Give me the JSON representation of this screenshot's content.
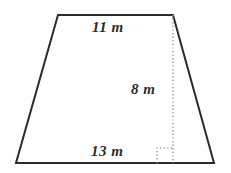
{
  "figure": {
    "kind": "trapezoid-geometry-diagram",
    "background_color": "#ffffff",
    "stroke_color": "#2b2b2b",
    "helper_line_color": "#9a9a9a",
    "label_color": "#2b2b2b",
    "unit": "m",
    "labels": {
      "top_base": "11 m",
      "height": "8 m",
      "bottom_base": "13 m"
    },
    "measurements": [
      {
        "name": "top-base",
        "value": 11,
        "unit": "m",
        "text": "11 m"
      },
      {
        "name": "height",
        "value": 8,
        "unit": "m",
        "text": "8 m"
      },
      {
        "name": "bottom-base",
        "value": 13,
        "unit": "m",
        "text": "13 m"
      }
    ],
    "geometry": {
      "vertices": {
        "top_left": [
          58,
          15
        ],
        "top_right": [
          173,
          15
        ],
        "bottom_right": [
          214,
          163
        ],
        "bottom_left": [
          16,
          163
        ]
      },
      "height_line": {
        "from": [
          173,
          15
        ],
        "to": [
          173,
          163
        ],
        "style": "dotted"
      },
      "right_angle_marker": {
        "x": 157,
        "y": 148,
        "size": 15,
        "style": "dotted"
      }
    }
  }
}
